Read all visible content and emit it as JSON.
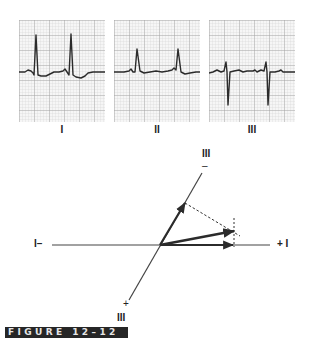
{
  "figure": {
    "label": "FIGURE 12–12"
  },
  "leads": [
    {
      "name": "I",
      "label": "I"
    },
    {
      "name": "II",
      "label": "II"
    },
    {
      "name": "III",
      "label": "III"
    }
  ],
  "vector_diagram": {
    "axis_I": {
      "negative_label": "I–",
      "positive_label": "+ I"
    },
    "axis_III": {
      "lead_label_top": "III",
      "negative_sign": "–",
      "positive_sign": "+",
      "lead_label_bottom": "III"
    }
  },
  "colors": {
    "trace": "#2b2b2b",
    "grid_major": "#9a9a9a",
    "grid_minor": "#cfcfcf",
    "label_bg": "#262626",
    "label_text": "#e6e6e6"
  }
}
